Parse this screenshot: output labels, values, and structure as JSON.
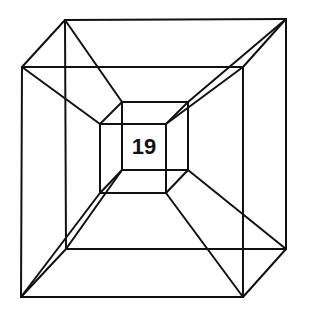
{
  "diagram": {
    "type": "hypercube-wireframe",
    "label": "19",
    "colors": {
      "stroke": "#111111",
      "background": "#ffffff"
    },
    "vertices": {
      "outer_back_tl": [
        65,
        20
      ],
      "outer_back_tr": [
        286,
        19
      ],
      "outer_back_br": [
        286,
        249
      ],
      "outer_back_bl": [
        66,
        249
      ],
      "outer_front_tl": [
        22,
        67
      ],
      "outer_front_tr": [
        243,
        67
      ],
      "outer_front_br": [
        243,
        297
      ],
      "outer_front_bl": [
        21,
        297
      ],
      "inner_back_tl": [
        122,
        102
      ],
      "inner_back_tr": [
        188,
        102
      ],
      "inner_back_br": [
        188,
        170
      ],
      "inner_back_bl": [
        122,
        170
      ],
      "inner_front_tl": [
        100,
        124
      ],
      "inner_front_tr": [
        166,
        124
      ],
      "inner_front_br": [
        166,
        193
      ],
      "inner_front_bl": [
        100,
        193
      ]
    }
  }
}
